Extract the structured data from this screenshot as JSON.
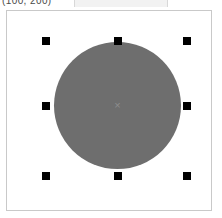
{
  "app": {
    "title": "Shape Editor Canvas",
    "background_color": "#ffffff"
  },
  "statusbar": {
    "coord_readout": "(100, 200)",
    "readout_field_value": ""
  },
  "canvas": {
    "name": "drawing-canvas",
    "border_color": "#c9c9c9",
    "background_color": "#ffffff",
    "width_px": 206,
    "height_px": 201
  },
  "shape": {
    "type": "ellipse",
    "label": "circle",
    "fill_color": "#6e6e6e",
    "stroke_color": "#6e6e6e",
    "selected": true,
    "center_marker_glyph": "×",
    "center_marker_color": "#8d8d8d",
    "bounds": {
      "x": 53,
      "y": 41,
      "width": 127,
      "height": 127
    }
  },
  "selection": {
    "handle_color": "#000000",
    "handle_size_px": 8,
    "handles": [
      {
        "name": "handle-top-left",
        "position": "top-left",
        "x": 41,
        "y": 36
      },
      {
        "name": "handle-top-center",
        "position": "top-center",
        "x": 113,
        "y": 36
      },
      {
        "name": "handle-top-right",
        "position": "top-right",
        "x": 182,
        "y": 36
      },
      {
        "name": "handle-middle-left",
        "position": "middle-left",
        "x": 41,
        "y": 101
      },
      {
        "name": "handle-middle-right",
        "position": "middle-right",
        "x": 182,
        "y": 101
      },
      {
        "name": "handle-bottom-left",
        "position": "bottom-left",
        "x": 41,
        "y": 171
      },
      {
        "name": "handle-bottom-center",
        "position": "bottom-center",
        "x": 113,
        "y": 171
      },
      {
        "name": "handle-bottom-right",
        "position": "bottom-right",
        "x": 182,
        "y": 171
      }
    ]
  }
}
